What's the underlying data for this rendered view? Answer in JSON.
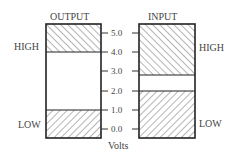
{
  "diagram": {
    "axis_label": "Volts",
    "ticks": [
      "5.0",
      "4.0",
      "3.0",
      "2.0",
      "1.0",
      "0.0"
    ],
    "output": {
      "title": "OUTPUT",
      "high_label": "HIGH",
      "low_label": "LOW",
      "high_range": [
        4.0,
        5.5
      ],
      "low_range": [
        -0.5,
        1.0
      ]
    },
    "input": {
      "title": "INPUT",
      "high_label": "HIGH",
      "low_label": "LOW",
      "high_range": [
        2.8,
        5.5
      ],
      "low_range": [
        -0.5,
        2.0
      ]
    }
  }
}
